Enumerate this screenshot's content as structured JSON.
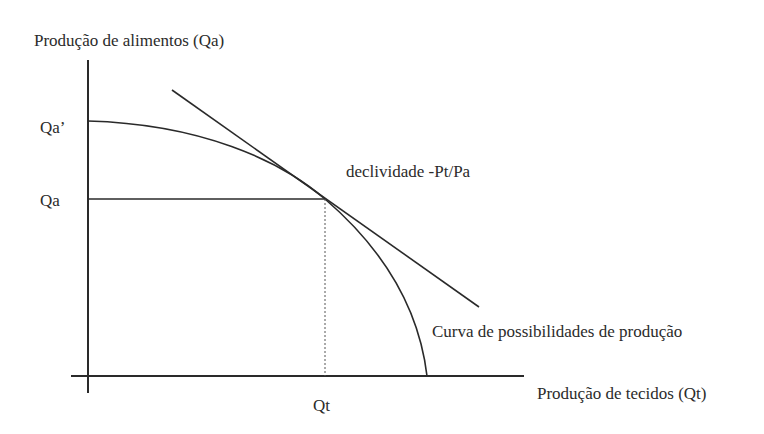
{
  "diagram": {
    "type": "production-possibility-frontier",
    "y_axis_label": "Produção de alimentos (Qa)",
    "x_axis_label": "Produção de tecidos (Qt)",
    "y_ticks": {
      "max_intercept": "Qa’",
      "equilibrium": "Qa"
    },
    "x_ticks": {
      "equilibrium": "Qt"
    },
    "tangent_label": "declividade -Pt/Pa",
    "curve_label": "Curva de possibilidades de produção",
    "line_color": "#2a2a2a"
  }
}
